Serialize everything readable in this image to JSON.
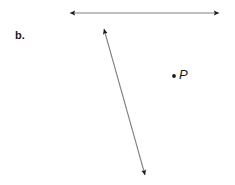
{
  "figure": {
    "part_label": "b.",
    "background_color": "#ffffff",
    "stroke_color": "#808080",
    "arrowhead_color": "#1a1a1a",
    "text_color": "#1a1a1a",
    "width": 235,
    "height": 185
  },
  "point": {
    "label": "P",
    "dot_color": "#1a1a1a",
    "x": 174,
    "y": 76
  },
  "lines": [
    {
      "name": "horizontal-line",
      "x1": 70,
      "y1": 13,
      "x2": 219,
      "y2": 13,
      "arrow_start": true,
      "arrow_end": true
    },
    {
      "name": "diagonal-line",
      "x1": 104,
      "y1": 29,
      "x2": 145,
      "y2": 175,
      "arrow_start": true,
      "arrow_end": true
    }
  ],
  "chart_data": {
    "type": "diagram",
    "title": "b.",
    "elements": [
      {
        "kind": "double-headed-arrow",
        "name": "horizontal-line",
        "from": [
          70,
          13
        ],
        "to": [
          219,
          13
        ],
        "length_px": 149,
        "angle_deg": 0
      },
      {
        "kind": "double-headed-arrow",
        "name": "diagonal-line",
        "from": [
          104,
          29
        ],
        "to": [
          145,
          175
        ],
        "length_px": 152,
        "angle_deg": 74.3
      },
      {
        "kind": "labeled-point",
        "name": "point-p",
        "label": "P",
        "at": [
          174,
          76
        ]
      }
    ]
  }
}
